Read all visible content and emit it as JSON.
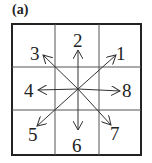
{
  "panel_label": "(a)",
  "directions": [
    {
      "id": 1,
      "label": "1",
      "x": 124,
      "y": 56
    },
    {
      "id": 2,
      "label": "2",
      "x": 78,
      "y": 45
    },
    {
      "id": 3,
      "label": "3",
      "x": 37,
      "y": 58
    },
    {
      "id": 4,
      "label": "4",
      "x": 30,
      "y": 96
    },
    {
      "id": 5,
      "label": "5",
      "x": 33,
      "y": 145
    },
    {
      "id": 6,
      "label": "6",
      "x": 77,
      "y": 153
    },
    {
      "id": 7,
      "label": "7",
      "x": 117,
      "y": 138
    },
    {
      "id": 8,
      "label": "8",
      "x": 130,
      "y": 98
    }
  ],
  "colors": {
    "lines": "#333333",
    "grid": "#555555"
  }
}
